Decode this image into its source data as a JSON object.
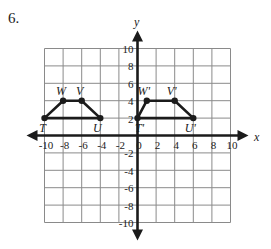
{
  "problem": {
    "number": "6."
  },
  "chart_data": {
    "type": "scatter",
    "title": "",
    "xlabel": "x",
    "ylabel": "y",
    "xlim": [
      -10,
      10
    ],
    "ylim": [
      -10,
      10
    ],
    "grid": true,
    "grid_step": 2,
    "legend": "none",
    "x_tick_labels": [
      "-10",
      "-8",
      "-6",
      "-4",
      "-2",
      "0",
      "2",
      "4",
      "6",
      "8",
      "10"
    ],
    "x_tick_values": [
      -10,
      -8,
      -6,
      -4,
      -2,
      0,
      2,
      4,
      6,
      8,
      10
    ],
    "y_tick_labels": [
      "10",
      "8",
      "6",
      "4",
      "2",
      "-2",
      "-4",
      "-6",
      "-8",
      "-10"
    ],
    "y_tick_values": [
      10,
      8,
      6,
      4,
      2,
      -2,
      -4,
      -6,
      -8,
      -10
    ],
    "series": [
      {
        "name": "TWVU",
        "closed": false,
        "points": [
          {
            "label": "T",
            "x": -10,
            "y": 2
          },
          {
            "label": "W",
            "x": -8,
            "y": 4
          },
          {
            "label": "V",
            "x": -6,
            "y": 4
          },
          {
            "label": "U",
            "x": -4,
            "y": 2
          }
        ],
        "edges": [
          [
            0,
            1
          ],
          [
            1,
            2
          ],
          [
            2,
            3
          ],
          [
            3,
            0
          ]
        ],
        "label_offsets": [
          {
            "dx": -2,
            "dy": 14
          },
          {
            "dx": -2,
            "dy": -6
          },
          {
            "dx": -2,
            "dy": -6
          },
          {
            "dx": -3,
            "dy": 14
          }
        ]
      },
      {
        "name": "T'W'V'U'",
        "closed": false,
        "points": [
          {
            "label": "T'",
            "x": 0,
            "y": 2
          },
          {
            "label": "W'",
            "x": 1,
            "y": 4
          },
          {
            "label": "V'",
            "x": 4,
            "y": 4
          },
          {
            "label": "U'",
            "x": 6,
            "y": 2
          }
        ],
        "edges": [
          [
            0,
            1
          ],
          [
            1,
            2
          ],
          [
            2,
            3
          ],
          [
            3,
            0
          ]
        ],
        "label_offsets": [
          {
            "dx": 2,
            "dy": 14
          },
          {
            "dx": -3,
            "dy": -6
          },
          {
            "dx": -3,
            "dy": -6
          },
          {
            "dx": -3,
            "dy": 14
          }
        ]
      }
    ]
  }
}
